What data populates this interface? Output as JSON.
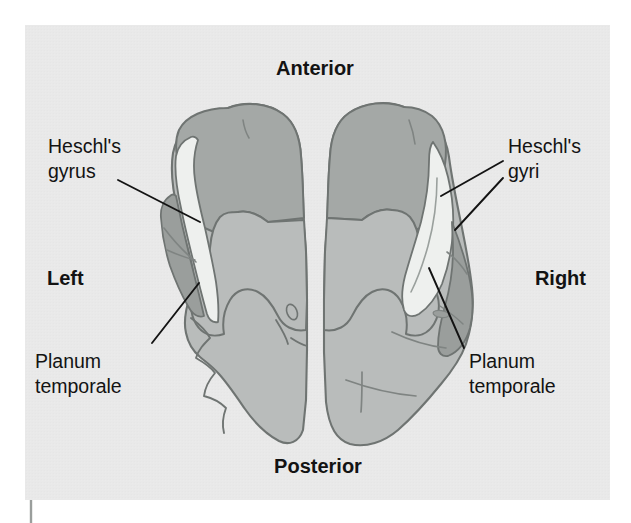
{
  "figure": {
    "kind": "anatomical-diagram",
    "panel": {
      "background_color": "#e9e9e9",
      "outer_background_color": "#ffffff",
      "x": 25,
      "y": 25,
      "width": 585,
      "height": 475
    },
    "colors": {
      "cortex_light_gray": "#b9bcbb",
      "cortex_mid_gray": "#a4a8a6",
      "cortex_dark_gray": "#9a9e9c",
      "heschl_white": "#eef0ee",
      "outline": "#6f7472",
      "text": "#131313",
      "leader_line": "#131313"
    }
  },
  "orientation_labels": [
    {
      "id": "anterior",
      "text": "Anterior",
      "x": 315,
      "y": 75,
      "anchor": "middle"
    },
    {
      "id": "posterior",
      "text": "Posterior",
      "x": 318,
      "y": 473,
      "anchor": "middle"
    },
    {
      "id": "left",
      "text": "Left",
      "x": 47,
      "y": 285,
      "anchor": "start"
    },
    {
      "id": "right",
      "text": "Right",
      "x": 586,
      "y": 285,
      "anchor": "end"
    }
  ],
  "structure_labels": [
    {
      "id": "heschls-gyrus-left",
      "lines": [
        "Heschl's",
        "gyrus"
      ],
      "x": 48,
      "y": 153,
      "anchor": "start",
      "line_height": 25,
      "leaders": [
        {
          "x1": 118,
          "y1": 180,
          "x2": 200,
          "y2": 222
        }
      ]
    },
    {
      "id": "heschls-gyri-right",
      "lines": [
        "Heschl's",
        "gyri"
      ],
      "x": 508,
      "y": 153,
      "anchor": "start",
      "line_height": 25,
      "leaders": [
        {
          "x1": 503,
          "y1": 161,
          "x2": 441,
          "y2": 196
        },
        {
          "x1": 503,
          "y1": 178,
          "x2": 455,
          "y2": 230
        }
      ]
    },
    {
      "id": "planum-temporale-left",
      "lines": [
        "Planum",
        "temporale"
      ],
      "x": 35,
      "y": 368,
      "anchor": "start",
      "line_height": 25,
      "leaders": [
        {
          "x1": 152,
          "y1": 343,
          "x2": 199,
          "y2": 283
        }
      ]
    },
    {
      "id": "planum-temporale-right",
      "lines": [
        "Planum",
        "temporale"
      ],
      "x": 469,
      "y": 368,
      "anchor": "start",
      "line_height": 25,
      "leaders": [
        {
          "x1": 464,
          "y1": 348,
          "x2": 429,
          "y2": 268
        }
      ]
    }
  ],
  "marks": {
    "bottom_left_tick": {
      "x": 31,
      "y1": 500,
      "y2": 523,
      "color": "#9a9e9c"
    }
  },
  "brain": {
    "left_hemisphere": {
      "outline_path": "M 288 116 C 284 140 283 170 282 200 C 281 232 280 268 278 296 C 264 300 252 307 246 318 C 238 306 226 300 214 302 C 213 288 214 272 212 258 C 209 238 204 218 199 200 C 196 184 195 166 197 150 C 200 132 210 120 226 113 C 244 105 268 106 288 116 Z",
      "regions": [
        {
          "id": "left-superior-temporal-gyrus",
          "fill": "cortex_mid_gray"
        },
        {
          "id": "left-heschls-gyrus-white",
          "fill": "heschl_white"
        },
        {
          "id": "left-planum-temporale",
          "fill": "cortex_dark_gray"
        },
        {
          "id": "left-posterior-cortex",
          "fill": "cortex_light_gray"
        }
      ]
    },
    "right_hemisphere": {
      "regions": [
        {
          "id": "right-superior-temporal-gyrus",
          "fill": "cortex_mid_gray"
        },
        {
          "id": "right-heschls-gyri-white",
          "fill": "heschl_white"
        },
        {
          "id": "right-planum-temporale",
          "fill": "cortex_dark_gray"
        },
        {
          "id": "right-posterior-cortex",
          "fill": "cortex_light_gray"
        }
      ]
    },
    "midline_fissure": {
      "id": "interhemispheric-fissure",
      "x": 314
    }
  }
}
